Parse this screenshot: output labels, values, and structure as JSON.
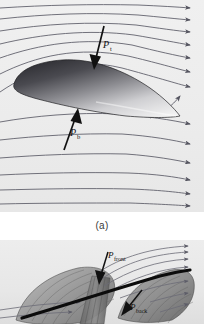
{
  "figure": {
    "panel_a": {
      "caption": "(a)",
      "subject": "airfoil-in-airflow",
      "background_color": "#eeeeee",
      "streamline_color": "#5a5a66",
      "streamline_count": 13,
      "flow_direction": "left-to-right",
      "airfoil": {
        "fill_dark": "#3d3d42",
        "fill_light": "#f2f2f2",
        "outline_color": "#2a2a2a"
      },
      "labels": [
        {
          "id": "pressure-top",
          "symbol": "P",
          "subscript": "t",
          "meaning": "pressure force on top surface",
          "arrow_direction": "downward",
          "arrow_color": "#111111"
        },
        {
          "id": "pressure-bottom",
          "symbol": "P",
          "subscript": "b",
          "meaning": "pressure force on bottom surface",
          "arrow_direction": "upward",
          "arrow_color": "#111111"
        }
      ]
    },
    "panel_b": {
      "caption": "",
      "subject": "sailboat-with-two-sails",
      "background_color": "#e9e9e9",
      "streamline_color": "#6b6b76",
      "streamline_count": 7,
      "flow_direction": "left-to-right",
      "boom_color": "#0c0c0c",
      "sails": {
        "front_fill": "#9a9a9a",
        "back_fill": "#8d8d8d",
        "rib_color": "#5e5e5e"
      },
      "labels": [
        {
          "id": "pressure-front",
          "symbol": "P",
          "subscript": "front",
          "meaning": "pressure force on front sail",
          "arrow_direction": "down-left",
          "arrow_color": "#111111"
        },
        {
          "id": "pressure-back",
          "symbol": "P",
          "subscript": "back",
          "meaning": "pressure force on back sail",
          "arrow_direction": "up-left",
          "arrow_color": "#111111"
        }
      ]
    }
  }
}
